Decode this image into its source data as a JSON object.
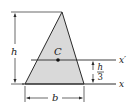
{
  "figure": {
    "type": "triangle-centroid-diagram",
    "shape": "triangle",
    "fill_color": "#d9d9d9",
    "stroke_color": "#2a2a2a",
    "labels": {
      "centroid": "C",
      "height": "h",
      "base": "b",
      "offset_numerator": "h",
      "offset_denominator": "3",
      "axis_base": "x",
      "axis_centroid": "x′"
    }
  }
}
